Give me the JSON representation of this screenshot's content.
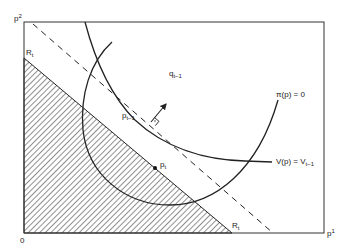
{
  "diagram": {
    "axes": {
      "y_label": "p",
      "y_label_sup": "2",
      "x_label": "p",
      "x_label_sup": "1",
      "origin_label": "0"
    },
    "points": {
      "R_y": {
        "base": "R",
        "sub": "t"
      },
      "R_x": {
        "base": "R",
        "sub": "t"
      },
      "p_prev": {
        "base": "p",
        "sub": "t−1"
      },
      "p_t": {
        "base": "p",
        "sub": "t"
      },
      "q_prev": {
        "base": "q",
        "sub": "t−1"
      }
    },
    "curves": {
      "profit": {
        "label": "π(p) = 0"
      },
      "value": {
        "label": "V(p) = V",
        "sub": "t−1"
      }
    },
    "colors": {
      "line": "#222222",
      "background": "#ffffff"
    }
  }
}
